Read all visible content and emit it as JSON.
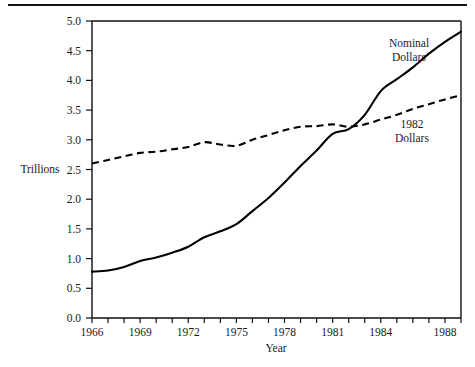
{
  "figure": {
    "background_color": "#ffffff",
    "ink_color": "#111111",
    "top_rule": true
  },
  "chart_data": {
    "type": "line",
    "title": "",
    "xlabel": "Year",
    "ylabel": "Trillions",
    "ylim": [
      0.0,
      5.0
    ],
    "xlim": [
      1966,
      1989
    ],
    "grid": false,
    "legend_position": "inline-annotations",
    "ytick_labels": [
      "0.0",
      "0.5",
      "1.0",
      "1.5",
      "2.0",
      "2.5",
      "3.0",
      "3.5",
      "4.0",
      "4.5",
      "5.0"
    ],
    "ytick_values": [
      0.0,
      0.5,
      1.0,
      1.5,
      2.0,
      2.5,
      3.0,
      3.5,
      4.0,
      4.5,
      5.0
    ],
    "xtick_labels": [
      "1966",
      "1969",
      "1972",
      "1975",
      "1978",
      "1981",
      "1984",
      "1988"
    ],
    "xtick_values": [
      1966,
      1969,
      1972,
      1975,
      1978,
      1981,
      1984,
      1988
    ],
    "xtick_minor_step": 1,
    "x": [
      1966,
      1967,
      1968,
      1969,
      1970,
      1971,
      1972,
      1973,
      1974,
      1975,
      1976,
      1977,
      1978,
      1979,
      1980,
      1981,
      1982,
      1983,
      1984,
      1985,
      1986,
      1987,
      1988,
      1989
    ],
    "series": [
      {
        "name": "Nominal Dollars",
        "style": "solid",
        "label_text_line1": "Nominal",
        "label_text_line2": "Dollars",
        "values": [
          0.78,
          0.8,
          0.86,
          0.96,
          1.02,
          1.1,
          1.2,
          1.36,
          1.46,
          1.58,
          1.8,
          2.02,
          2.28,
          2.56,
          2.82,
          3.1,
          3.18,
          3.42,
          3.82,
          4.02,
          4.22,
          4.45,
          4.65,
          4.82
        ]
      },
      {
        "name": "1982 Dollars",
        "style": "dashed",
        "label_text_line1": "1982",
        "label_text_line2": "Dollars",
        "values": [
          2.6,
          2.66,
          2.72,
          2.78,
          2.8,
          2.84,
          2.88,
          2.96,
          2.92,
          2.9,
          3.0,
          3.08,
          3.16,
          3.22,
          3.23,
          3.26,
          3.22,
          3.26,
          3.34,
          3.42,
          3.52,
          3.6,
          3.68,
          3.75
        ]
      }
    ]
  },
  "annotations": {
    "nominal_label": {
      "line1": "Nominal",
      "line2": "Dollars"
    },
    "real_label": {
      "line1": "1982",
      "line2": "Dollars"
    }
  }
}
